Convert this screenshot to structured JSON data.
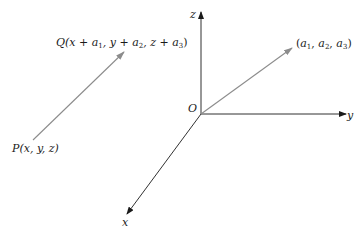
{
  "diagram": {
    "axes": {
      "z": {
        "label": "z"
      },
      "y": {
        "label": "y"
      },
      "x": {
        "label": "x"
      },
      "origin": {
        "label": "O"
      }
    },
    "position_vector": {
      "tip_label": {
        "open": "(",
        "a1": "a",
        "a1_sub": "1",
        "sep1": ", ",
        "a2": "a",
        "a2_sub": "2",
        "sep2": ", ",
        "a3": "a",
        "a3_sub": "3",
        "close": ")"
      }
    },
    "translated_vector": {
      "start_label": "P(x, y, z)",
      "end_label": {
        "prefix": "Q(x + ",
        "a1": "a",
        "a1_sub": "1",
        "mid1": ", y + ",
        "a2": "a",
        "a2_sub": "2",
        "mid2": ", z + ",
        "a3": "a",
        "a3_sub": "3",
        "close": ")"
      }
    },
    "colors": {
      "axis": "#1a1a1a",
      "vector": "#8c8c8c",
      "text": "#1a1a1a"
    }
  }
}
